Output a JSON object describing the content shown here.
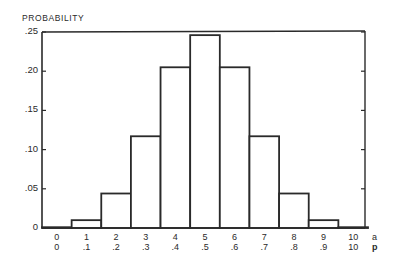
{
  "chart_data": {
    "type": "bar",
    "title": "",
    "ylabel": "PROBABILITY",
    "xlabel": "",
    "x_axis_rows": [
      {
        "key": "a",
        "labels": [
          "0",
          "1",
          "2",
          "3",
          "4",
          "5",
          "6",
          "7",
          "8",
          "9",
          "10"
        ]
      },
      {
        "key": "p",
        "labels": [
          "0",
          ".1",
          ".2",
          ".3",
          ".4",
          ".5",
          ".6",
          ".7",
          ".8",
          ".9",
          "10"
        ]
      }
    ],
    "categories": [
      "0",
      "1",
      "2",
      "3",
      "4",
      "5",
      "6",
      "7",
      "8",
      "9",
      "10"
    ],
    "values": [
      0.001,
      0.01,
      0.044,
      0.117,
      0.205,
      0.246,
      0.205,
      0.117,
      0.044,
      0.01,
      0.001
    ],
    "yticks": [
      0,
      0.05,
      0.1,
      0.15,
      0.2,
      0.25
    ],
    "ytick_labels": [
      "0",
      ".05",
      ".10",
      ".15",
      ".20",
      ".25"
    ],
    "ylim": [
      0,
      0.25
    ],
    "grid": false,
    "legend": null,
    "bar_style": {
      "fill": "#ffffff",
      "stroke": "#2a2a2a"
    }
  }
}
